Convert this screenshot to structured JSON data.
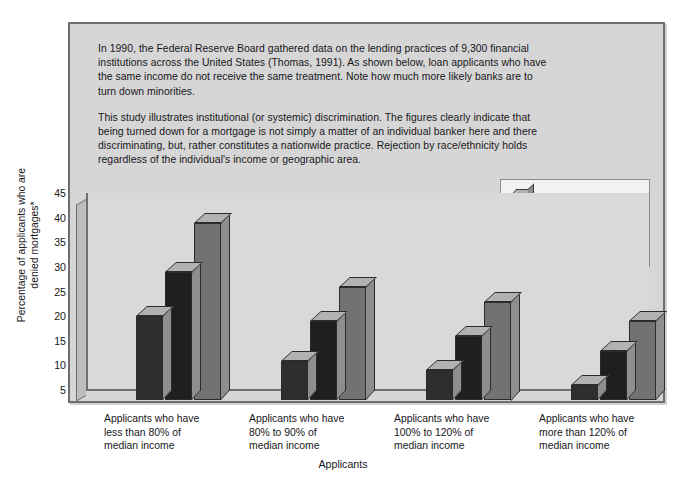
{
  "panel": {
    "intro_paragraphs": [
      "In 1990, the Federal Reserve Board gathered data on the lending practices of 9,300 financial institutions across the United States (Thomas, 1991). As shown below, loan applicants who have the same income do not receive the same treatment. Note how much more likely banks are to turn down minorities.",
      "This study illustrates institutional (or systemic) discrimination. The figures clearly indicate that being turned down for a mortgage is not simply a matter of an individual banker here and there discriminating, but, rather constitutes a nationwide practice. Rejection by race/ethnicity holds regardless of the individual's income or geographic area."
    ]
  },
  "chart_data": {
    "type": "bar",
    "title": "",
    "xlabel": "Applicants",
    "ylabel": "Percentage of applicants who are denied mortgages*",
    "ylim": [
      5,
      45
    ],
    "yticks": [
      45,
      40,
      35,
      30,
      25,
      20,
      15,
      10,
      5
    ],
    "grid": false,
    "legend_position": "top-right",
    "categories": [
      "Applicants who have less than 80% of median income",
      "Applicants who have 80% to 90% of median income",
      "Applicants who have 100% to 120% of median income",
      "Applicants who have more than 120% of median income"
    ],
    "category_lines": [
      [
        "Applicants who have",
        "less than 80% of",
        "median income"
      ],
      [
        "Applicants who have",
        "80% to 90% of",
        "median income"
      ],
      [
        "Applicants who have",
        "100% to 120% of",
        "median income"
      ],
      [
        "Applicants who have",
        "more than 120% of",
        "median income"
      ]
    ],
    "series": [
      {
        "name": "White",
        "color": "#2e2e2e",
        "values": [
          22,
          13,
          11,
          8
        ]
      },
      {
        "name": "Hispanic American",
        "color": "#1f1f1f",
        "values": [
          31,
          21,
          18,
          15
        ]
      },
      {
        "name": "African American",
        "color": "#727272",
        "values": [
          41,
          28,
          25,
          21
        ]
      }
    ]
  },
  "legend": {
    "items": [
      {
        "label": "White",
        "color": "#2e2e2e"
      },
      {
        "label": "Hispanic American",
        "color": "#1f1f1f"
      },
      {
        "label": "African American",
        "color": "#727272"
      }
    ]
  }
}
